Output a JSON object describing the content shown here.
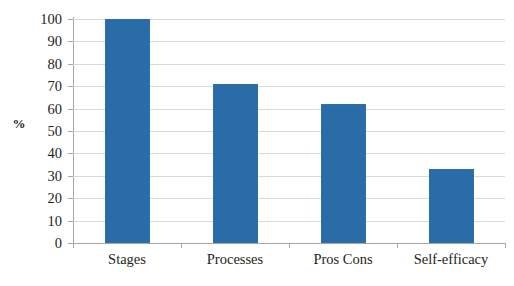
{
  "chart_data": {
    "type": "bar",
    "title": "",
    "xlabel": "",
    "ylabel": "%",
    "categories": [
      "Stages",
      "Processes",
      "Pros Cons",
      "Self-efficacy"
    ],
    "values": [
      100,
      71,
      62,
      33
    ],
    "ylim": [
      0,
      100
    ],
    "yticks": [
      0,
      10,
      20,
      30,
      40,
      50,
      60,
      70,
      80,
      90,
      100
    ],
    "ytick_labels": [
      "0",
      "10",
      "20",
      "30",
      "40",
      "50",
      "60",
      "70",
      "80",
      "90",
      "100"
    ],
    "grid": true,
    "legend": false,
    "series": [
      {
        "name": "",
        "values": [
          100,
          71,
          62,
          33
        ],
        "color": "#2a6ca8"
      }
    ],
    "colors": {
      "bar": "#2a6ca8",
      "bar_border": "#2f6fa8",
      "gridline": "#d9d9d9",
      "axis": "#a6a6a6",
      "text": "#231f20",
      "background": "#ffffff"
    }
  },
  "cropped_header": {
    "note": "partially cut off text at top edge",
    "text": ""
  }
}
